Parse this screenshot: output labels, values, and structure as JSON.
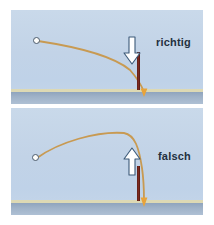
{
  "figure": {
    "title_visible": false,
    "background_color": "#ffffff",
    "panel_count": 2
  },
  "colors": {
    "sky": "#c2d3e7",
    "ground_line": "#ddd9b4",
    "ground_band": "#9fb2c8",
    "trajectory": "#c89a52",
    "post": "#5c1d18",
    "arrowhead": "#e8a33a",
    "block_arrow_fill": "#ffffff",
    "block_arrow_stroke": "#3d5a78",
    "label_text": "#24313f",
    "ball_fill": "#fdfdfb",
    "ball_stroke": "#4a5a6b"
  },
  "panels": [
    {
      "id": "top",
      "label": "richtig",
      "arrow_icon": "arrow-down-icon",
      "arrow_direction": "down",
      "trajectory_shape": "gentle-descent-then-steep-drop",
      "ball_position": "upper-left",
      "post_present": true,
      "impact_arrowhead_direction": "down"
    },
    {
      "id": "bottom",
      "label": "falsch",
      "arrow_icon": "arrow-up-icon",
      "arrow_direction": "up",
      "trajectory_shape": "rising-arc-peak-then-steep-drop",
      "ball_position": "left",
      "post_present": true,
      "impact_arrowhead_direction": "down"
    }
  ]
}
